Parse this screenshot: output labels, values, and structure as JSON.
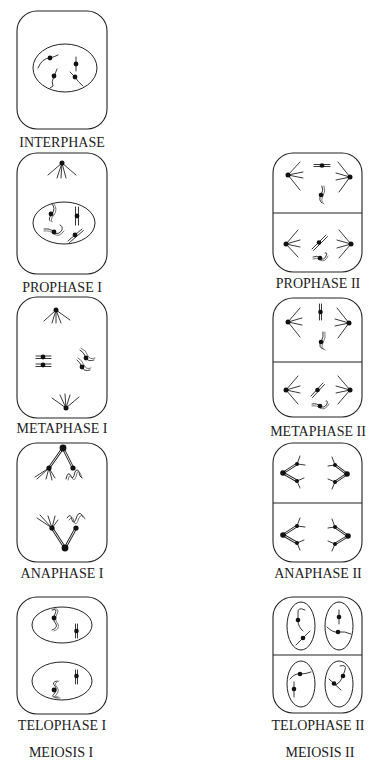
{
  "diagram": {
    "meiosis_1": {
      "title": "MEIOSIS I",
      "stages": [
        {
          "label": "INTERPHASE"
        },
        {
          "label": "PROPHASE I"
        },
        {
          "label": "METAPHASE I"
        },
        {
          "label": "ANAPHASE I"
        },
        {
          "label": "TELOPHASE I"
        }
      ]
    },
    "meiosis_2": {
      "title": "MEIOSIS II",
      "stages": [
        {
          "label": "PROPHASE II"
        },
        {
          "label": "METAPHASE II"
        },
        {
          "label": "ANAPHASE II"
        },
        {
          "label": "TELOPHASE II"
        }
      ]
    },
    "colors": {
      "line": "#222222",
      "background": "#ffffff"
    }
  }
}
